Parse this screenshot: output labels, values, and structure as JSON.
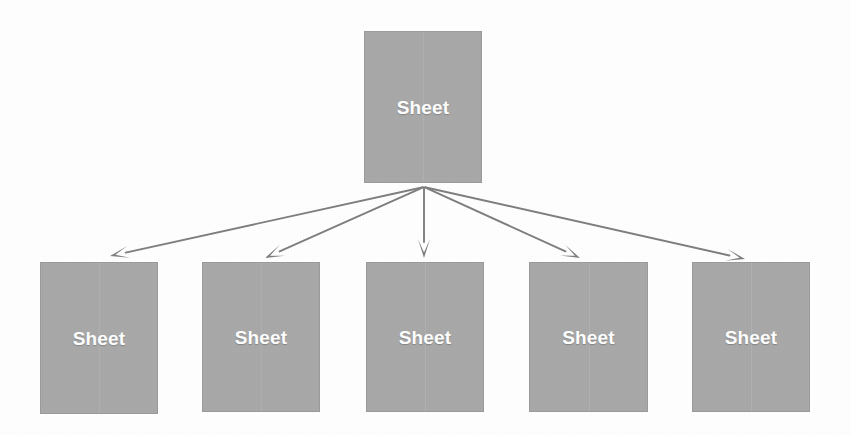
{
  "figure": {
    "name": "sheet-fan-out-diagram",
    "background_color": "#ffffff",
    "width": 851,
    "height": 435
  },
  "style": {
    "node_fill": "#a9a9a9",
    "node_border": "#9b9b9b",
    "label_color": "#ffffff",
    "arrow_color": "#7f7f7f"
  },
  "parent": {
    "label": "Sheet",
    "x": 364,
    "y": 31,
    "width": 118,
    "height": 152
  },
  "fan_origin": {
    "x": 424,
    "y": 187
  },
  "children": [
    {
      "label": "Sheet",
      "x": 40,
      "y": 262,
      "width": 118,
      "height": 152,
      "arrow_tip_x": 110,
      "arrow_tip_y": 256
    },
    {
      "label": "Sheet",
      "x": 202,
      "y": 262,
      "width": 118,
      "height": 150,
      "arrow_tip_x": 265,
      "arrow_tip_y": 258
    },
    {
      "label": "Sheet",
      "x": 366,
      "y": 262,
      "width": 118,
      "height": 150,
      "arrow_tip_x": 424,
      "arrow_tip_y": 258
    },
    {
      "label": "Sheet",
      "x": 529,
      "y": 262,
      "width": 119,
      "height": 150,
      "arrow_tip_x": 580,
      "arrow_tip_y": 258
    },
    {
      "label": "Sheet",
      "x": 692,
      "y": 262,
      "width": 118,
      "height": 150,
      "arrow_tip_x": 745,
      "arrow_tip_y": 259
    }
  ],
  "connectors": [
    {
      "name": "arrow-to-child-1",
      "from_x": 424,
      "from_y": 187,
      "to_x": 110,
      "to_y": 256
    },
    {
      "name": "arrow-to-child-2",
      "from_x": 424,
      "from_y": 187,
      "to_x": 265,
      "to_y": 258
    },
    {
      "name": "arrow-to-child-3",
      "from_x": 424,
      "from_y": 187,
      "to_x": 424,
      "to_y": 258
    },
    {
      "name": "arrow-to-child-4",
      "from_x": 424,
      "from_y": 187,
      "to_x": 580,
      "to_y": 258
    },
    {
      "name": "arrow-to-child-5",
      "from_x": 424,
      "from_y": 187,
      "to_x": 745,
      "to_y": 259
    }
  ]
}
